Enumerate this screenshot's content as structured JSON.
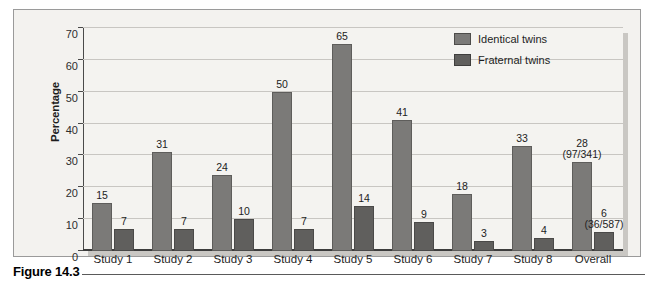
{
  "figure": {
    "caption_label": "Figure 14.3"
  },
  "legend": {
    "position": "top-right",
    "items": [
      {
        "label": "Identical twins",
        "color": "#7b7a78",
        "swatch_name": "identical-twins-swatch"
      },
      {
        "label": "Fraternal twins",
        "color": "#605f5d",
        "swatch_name": "fraternal-twins-swatch"
      }
    ]
  },
  "chart_data": {
    "type": "bar",
    "title": "",
    "xlabel": "",
    "ylabel": "Percentage",
    "ylim": [
      0,
      70
    ],
    "yticks": [
      0,
      10,
      20,
      30,
      40,
      50,
      60,
      70
    ],
    "ytick_labels": [
      "0",
      "10",
      "20",
      "30",
      "40",
      "50",
      "60",
      "70"
    ],
    "grid": true,
    "grid_axis": "y",
    "legend_position": "top-right",
    "categories": [
      "Study 1",
      "Study 2",
      "Study 3",
      "Study 4",
      "Study 5",
      "Study 6",
      "Study 7",
      "Study 8",
      "Overall"
    ],
    "series": [
      {
        "name": "Identical twins",
        "color": "#7b7a78",
        "values": [
          15,
          31,
          24,
          50,
          65,
          41,
          18,
          33,
          28
        ],
        "value_labels": [
          "15",
          "31",
          "24",
          "50",
          "65",
          "41",
          "18",
          "33",
          "28"
        ],
        "annotations": [
          "",
          "",
          "",
          "",
          "",
          "",
          "",
          "",
          "(97/341)"
        ]
      },
      {
        "name": "Fraternal twins",
        "color": "#605f5d",
        "values": [
          7,
          7,
          10,
          7,
          14,
          9,
          3,
          4,
          6
        ],
        "value_labels": [
          "7",
          "7",
          "10",
          "7",
          "14",
          "9",
          "3",
          "4",
          "6"
        ],
        "annotations": [
          "",
          "",
          "",
          "",
          "",
          "",
          "",
          "",
          "(36/587)"
        ]
      }
    ]
  }
}
